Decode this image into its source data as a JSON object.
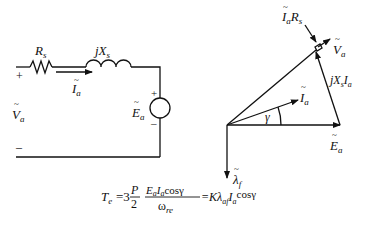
{
  "circuit": {
    "resistor_label": "R",
    "resistor_sub": "s",
    "inductor_label": "jX",
    "inductor_sub": "s",
    "current_label": "I",
    "current_sub": "a",
    "voltage_label": "V",
    "voltage_sub": "a",
    "source_label": "E",
    "source_sub": "a",
    "plus": "+",
    "minus": "–"
  },
  "phasor": {
    "drop_r_label": "I",
    "drop_r_sub": "a",
    "drop_r_label2": "R",
    "drop_r_sub2": "s",
    "va_label": "V",
    "va_sub": "a",
    "jx_label": "jX",
    "jx_sub": "s",
    "jx_label2": "I",
    "jx_sub2": "a",
    "ia_label": "I",
    "ia_sub": "a",
    "gamma": "γ",
    "ea_label": "E",
    "ea_sub": "a",
    "lambda_label": "λ",
    "lambda_sub": "f"
  },
  "equation": {
    "lhs": "T",
    "lhs_sub": "e",
    "eq": "=3",
    "frac1_num": "P",
    "frac1_den": "2",
    "frac2_num": "E",
    "frac2_num_sub": "a",
    "frac2_num2": "I",
    "frac2_num2_sub": "a",
    "frac2_num3": "cosγ",
    "frac2_den": "ω",
    "frac2_den_sub": "re",
    "rhs": "=Kλ",
    "rhs_sub": "af",
    "rhs2": "I",
    "rhs2_sub": "a",
    "rhs3": "cosγ"
  }
}
